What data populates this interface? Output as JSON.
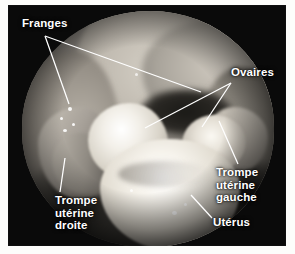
{
  "figure": {
    "kind": "annotated-photograph",
    "language": "fr",
    "label_color": "#ffffff",
    "leader_color": "#ffffff",
    "plate_background": "#0a0a0a"
  },
  "labels": {
    "franges": "Franges",
    "ovaires": "Ovaires",
    "trompe_uterine_gauche": "Trompe\nutérine\ngauche",
    "trompe_uterine_droite": "Trompe\nutérine\ndroite",
    "uterus": "Utérus"
  }
}
